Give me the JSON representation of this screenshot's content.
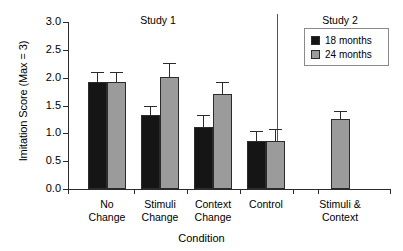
{
  "chart_data": {
    "type": "bar",
    "title": "",
    "xlabel": "Condition",
    "ylabel": "Imitation Score (Max = 3)",
    "ylim": [
      0,
      3
    ],
    "ytick_labels": [
      "0.0",
      "0.5",
      "1.0",
      "1.5",
      "2.0",
      "2.5",
      "3.0"
    ],
    "ytick_values": [
      0,
      0.5,
      1.0,
      1.5,
      2.0,
      2.5,
      3.0
    ],
    "grid": false,
    "legend_position": "top-right",
    "panels": [
      {
        "name": "study1",
        "label": "Study 1"
      },
      {
        "name": "study2",
        "label": "Study 2"
      }
    ],
    "categories": [
      "No Change",
      "Stimuli Change",
      "Context Change",
      "Control",
      "Stimuli & Context"
    ],
    "category_lines": [
      [
        "No",
        "Change"
      ],
      [
        "Stimuli",
        "Change"
      ],
      [
        "Context",
        "Change"
      ],
      [
        "Control",
        ""
      ],
      [
        "Stimuli &",
        "Context"
      ]
    ],
    "series": [
      {
        "name": "18 months",
        "color": "#151515",
        "values": [
          1.92,
          1.33,
          1.11,
          0.87,
          null
        ],
        "errors": [
          0.19,
          0.17,
          0.22,
          0.17,
          null
        ]
      },
      {
        "name": "24 months",
        "color": "#9b9b9b",
        "values": [
          1.92,
          2.02,
          1.7,
          0.87,
          1.25
        ],
        "errors": [
          0.18,
          0.24,
          0.22,
          0.2,
          0.16
        ]
      }
    ]
  },
  "legend": {
    "items": [
      {
        "label": "18 months",
        "swatch": "dark"
      },
      {
        "label": "24 months",
        "swatch": "light"
      }
    ]
  }
}
